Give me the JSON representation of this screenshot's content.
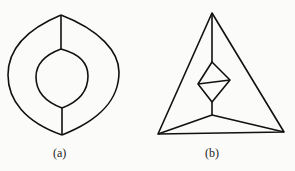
{
  "figures": [
    {
      "id": "a",
      "label": "(a)",
      "description": "Eye-shaped outer lens with inner lens, connected by vertical edges at top and bottom"
    },
    {
      "id": "b",
      "label": "(b)",
      "description": "Triangle containing diamond with diagonal, connected to apex and to bottom corners via central junction"
    }
  ],
  "colors": {
    "stroke": "#111111",
    "background": "#fbfbf9"
  }
}
